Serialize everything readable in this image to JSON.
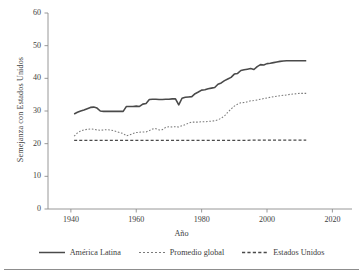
{
  "chart_data": {
    "type": "line",
    "title": "",
    "xlabel": "Año",
    "ylabel": "Semejanza con Estados Unidos",
    "xlim": [
      1933,
      2026
    ],
    "ylim": [
      0,
      60
    ],
    "xticks": [
      1940,
      1960,
      1980,
      2000,
      2020
    ],
    "yticks": [
      0,
      10,
      20,
      30,
      40,
      50,
      60
    ],
    "grid": false,
    "legend_position": "bottom",
    "x": [
      1941,
      1942,
      1943,
      1944,
      1945,
      1946,
      1947,
      1948,
      1949,
      1950,
      1951,
      1952,
      1953,
      1954,
      1955,
      1956,
      1957,
      1958,
      1959,
      1960,
      1961,
      1962,
      1963,
      1964,
      1965,
      1966,
      1967,
      1968,
      1969,
      1970,
      1971,
      1972,
      1973,
      1974,
      1975,
      1976,
      1977,
      1978,
      1979,
      1980,
      1981,
      1982,
      1983,
      1984,
      1985,
      1986,
      1987,
      1988,
      1989,
      1990,
      1991,
      1992,
      1993,
      1994,
      1995,
      1996,
      1997,
      1998,
      1999,
      2000,
      2001,
      2002,
      2003,
      2004,
      2005,
      2006,
      2007,
      2008,
      2009,
      2010,
      2011,
      2012
    ],
    "series": [
      {
        "name": "América Latina",
        "style": "solid",
        "color": "#4a4a4a",
        "values": [
          29.1,
          29.6,
          30.0,
          30.3,
          30.7,
          31.1,
          31.2,
          30.9,
          30.0,
          29.9,
          29.9,
          29.9,
          29.9,
          29.9,
          29.9,
          29.9,
          31.4,
          31.4,
          31.4,
          31.5,
          31.4,
          32.1,
          32.3,
          33.5,
          33.6,
          33.6,
          33.5,
          33.5,
          33.6,
          33.6,
          33.7,
          33.7,
          31.9,
          33.9,
          34.2,
          34.3,
          34.4,
          35.3,
          35.8,
          36.4,
          36.5,
          36.8,
          37.0,
          37.2,
          38.2,
          38.6,
          39.3,
          39.8,
          40.3,
          41.3,
          41.5,
          42.4,
          42.6,
          42.8,
          43.0,
          42.7,
          43.6,
          44.2,
          44.1,
          44.5,
          44.6,
          44.8,
          45.0,
          45.2,
          45.3,
          45.4,
          45.4,
          45.4,
          45.4,
          45.4,
          45.4,
          45.4
        ]
      },
      {
        "name": "Promedio global",
        "style": "dotted",
        "color": "#7a7a7a",
        "values": [
          22.3,
          23.3,
          23.9,
          24.2,
          24.4,
          24.5,
          24.4,
          24.2,
          24.1,
          24.2,
          24.3,
          24.2,
          24.0,
          23.7,
          23.4,
          23.1,
          22.4,
          22.7,
          23.1,
          23.4,
          23.5,
          23.6,
          23.6,
          24.0,
          24.5,
          24.6,
          24.2,
          24.3,
          25.0,
          25.2,
          25.1,
          25.2,
          25.1,
          25.5,
          25.8,
          26.3,
          26.6,
          26.6,
          26.6,
          26.7,
          26.7,
          26.8,
          26.9,
          27.0,
          27.3,
          27.8,
          28.5,
          29.6,
          30.6,
          31.5,
          32.1,
          32.5,
          32.6,
          32.8,
          33.1,
          33.2,
          33.4,
          33.6,
          33.8,
          34.0,
          34.2,
          34.4,
          34.5,
          34.7,
          34.8,
          34.9,
          35.1,
          35.2,
          35.3,
          35.4,
          35.4,
          35.4
        ]
      },
      {
        "name": "Estados Unidos",
        "style": "dashed",
        "color": "#4a4a4a",
        "values": [
          21.0,
          21.0,
          21.0,
          21.0,
          21.0,
          21.0,
          21.0,
          21.0,
          21.0,
          21.0,
          21.0,
          21.0,
          21.0,
          21.0,
          21.0,
          21.0,
          21.0,
          21.0,
          21.0,
          21.0,
          21.0,
          21.0,
          21.0,
          21.0,
          21.0,
          21.0,
          21.0,
          21.0,
          21.0,
          21.0,
          21.0,
          21.0,
          21.0,
          21.0,
          21.0,
          21.0,
          21.0,
          21.0,
          21.0,
          21.0,
          21.0,
          21.0,
          21.0,
          21.0,
          21.0,
          21.0,
          21.0,
          21.0,
          21.0,
          21.0,
          21.0,
          21.0,
          21.0,
          21.0,
          21.1,
          21.1,
          21.1,
          21.1,
          21.1,
          21.1,
          21.1,
          21.1,
          21.1,
          21.1,
          21.1,
          21.1,
          21.1,
          21.1,
          21.1,
          21.1,
          21.1,
          21.1
        ]
      }
    ]
  },
  "axis": {
    "y_title": "Semejanza con Estados Unidos",
    "x_title": "Año",
    "y_tick_labels": [
      "60",
      "50",
      "40",
      "30",
      "20",
      "10",
      "0"
    ],
    "x_tick_labels": [
      "1940",
      "1960",
      "1980",
      "2000",
      "2020"
    ]
  },
  "legend": {
    "items": [
      {
        "label": "América Latina"
      },
      {
        "label": "Promedio global"
      },
      {
        "label": "Estados Unidos"
      }
    ]
  }
}
